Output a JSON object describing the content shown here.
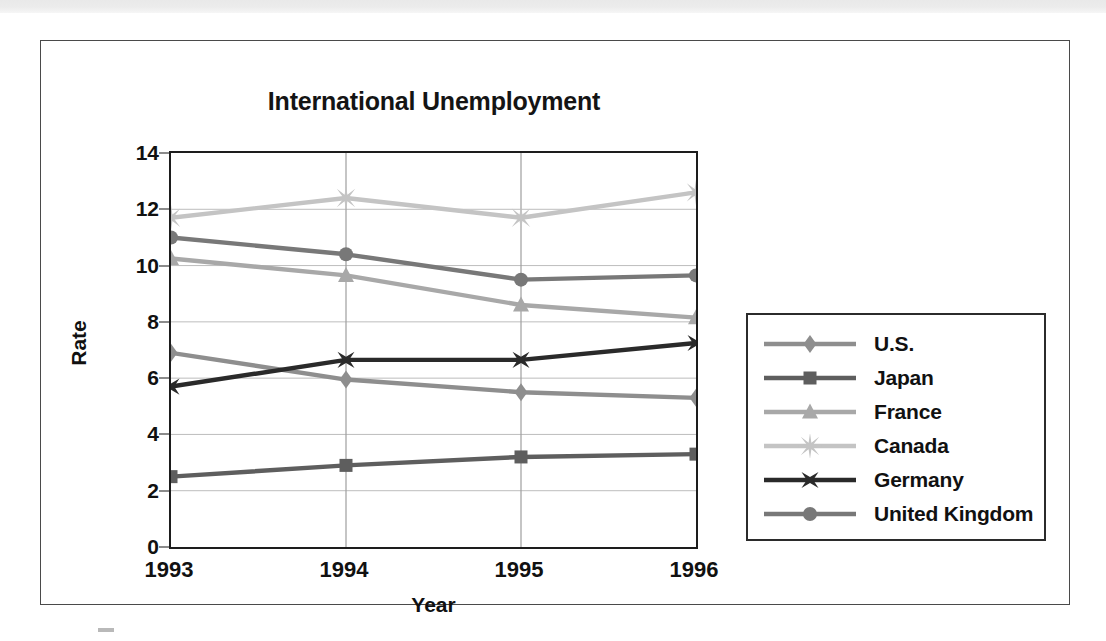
{
  "page": {
    "top_band": "scan-edge-band",
    "bottom_mark": "scan-margin-mark"
  },
  "chart_data": {
    "type": "line",
    "title": "International Unemployment",
    "xlabel": "Year",
    "ylabel": "Rate",
    "categories": [
      "1993",
      "1994",
      "1995",
      "1996"
    ],
    "x": [
      1993,
      1994,
      1995,
      1996
    ],
    "ylim": [
      0,
      14
    ],
    "yticks": [
      0,
      2,
      4,
      6,
      8,
      10,
      12,
      14
    ],
    "ytick_labels": [
      "0",
      "2",
      "4",
      "6",
      "8",
      "10",
      "12",
      "14"
    ],
    "grid": "horizontal-and-vertical-light",
    "legend_position": "right-outside",
    "series": [
      {
        "name": "U.S.",
        "marker": "diamond",
        "color": "#8e8e8e",
        "values": [
          6.9,
          5.95,
          5.5,
          5.3
        ]
      },
      {
        "name": "Japan",
        "marker": "square",
        "color": "#5e5e5e",
        "values": [
          2.5,
          2.9,
          3.2,
          3.3
        ]
      },
      {
        "name": "France",
        "marker": "triangle",
        "color": "#a8a8a8",
        "values": [
          10.25,
          9.65,
          8.6,
          8.15
        ]
      },
      {
        "name": "Canada",
        "marker": "star8",
        "color": "#c4c4c4",
        "values": [
          11.7,
          12.4,
          11.7,
          12.6
        ]
      },
      {
        "name": "Germany",
        "marker": "x-cross",
        "color": "#2a2a2a",
        "values": [
          5.7,
          6.65,
          6.65,
          7.25
        ]
      },
      {
        "name": "United Kingdom",
        "marker": "circle",
        "color": "#787878",
        "values": [
          11.0,
          10.4,
          9.5,
          9.65
        ]
      }
    ]
  },
  "legend": {
    "items": [
      {
        "label": "U.S."
      },
      {
        "label": "Japan"
      },
      {
        "label": "France"
      },
      {
        "label": "Canada"
      },
      {
        "label": "Germany"
      },
      {
        "label": "United Kingdom"
      }
    ]
  }
}
